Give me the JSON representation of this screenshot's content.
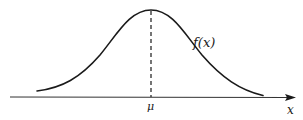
{
  "diagram": {
    "type": "normal-distribution-curve",
    "curve_label": "f(x)",
    "mean_label": "μ",
    "axis_label": "x",
    "colors": {
      "stroke": "#1a1a1a",
      "axis": "#333333",
      "background": "#ffffff"
    },
    "elements": [
      {
        "kind": "curve",
        "description": "symmetric bell-shaped density curve",
        "label": "f(x)"
      },
      {
        "kind": "dashed-line",
        "description": "vertical dashed line from peak down to axis at mean",
        "label": "μ"
      },
      {
        "kind": "axis",
        "description": "horizontal x-axis with arrowhead at right end",
        "label": "x"
      }
    ]
  }
}
